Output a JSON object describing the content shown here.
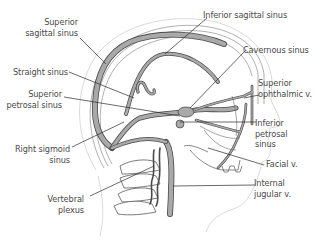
{
  "figure": {
    "colors": {
      "vessel_fill": "#a9a9a9",
      "vessel_stroke": "#4a4a4a",
      "outline": "#6a6a6a",
      "skin_outline": "#c8c8c8",
      "leader_line": "#2a2a2a",
      "label_text": "#4a4a4a"
    }
  },
  "labels": {
    "superior_sagittal_sinus": [
      "Superior",
      "sagittal sinus"
    ],
    "inferior_sagittal_sinus": [
      "Inferior sagittal sinus"
    ],
    "cavernous_sinus": [
      "Cavernous sinus"
    ],
    "straight_sinus": [
      "Straight sinus"
    ],
    "superior_petrosal_sinus": [
      "Superior",
      "petrosal sinus"
    ],
    "superior_ophthalmic_v": [
      "Superior",
      "ophthalmic v."
    ],
    "inferior_petrosal_sinus": [
      "Inferior",
      "petrosal",
      "sinus"
    ],
    "right_sigmoid_sinus": [
      "Right sigmoid",
      "sinus"
    ],
    "facial_v": [
      "Facial v."
    ],
    "internal_jugular_v": [
      "Internal",
      "jugular v."
    ],
    "vertebral_plexus": [
      "Vertebral",
      "plexus"
    ]
  }
}
